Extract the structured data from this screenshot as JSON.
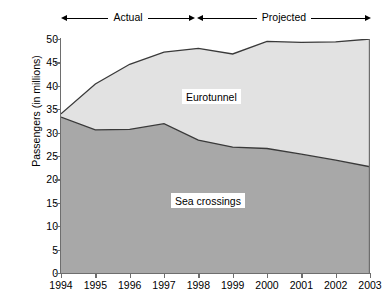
{
  "annotations": {
    "actual_label": "Actual",
    "projected_label": "Projected"
  },
  "axes": {
    "ylabel": "Passengers (in millions)",
    "yticks": [
      "50",
      "45",
      "40",
      "35",
      "30",
      "25",
      "20",
      "15",
      "10",
      "5",
      "0"
    ],
    "xticks": [
      "1994",
      "1995",
      "1996",
      "1997",
      "1998",
      "1999",
      "2000",
      "2001",
      "2002",
      "2003"
    ]
  },
  "series_labels": {
    "eurotunnel": "Eurotunnel",
    "sea_crossings": "Sea crossings"
  },
  "colors": {
    "eurotunnel_fill": "#e2e2e2",
    "sea_fill": "#a8a8a8",
    "line": "#3a3a3a",
    "axis": "#6e6e6e",
    "text": "#000000"
  },
  "chart_data": {
    "type": "area",
    "title": "",
    "subtitle": "",
    "xlabel": "",
    "ylabel": "Passengers (in millions)",
    "x": [
      1994,
      1995,
      1996,
      1997,
      1998,
      1999,
      2000,
      2001,
      2002,
      2003
    ],
    "xlim": [
      1994,
      2003
    ],
    "ylim": [
      0,
      50
    ],
    "ytick_step": 5,
    "grid": false,
    "legend": "inline-labels",
    "stacked": true,
    "series": [
      {
        "name": "Sea crossings",
        "values": [
          33.3,
          30.6,
          30.7,
          31.9,
          28.4,
          26.9,
          26.6,
          25.4,
          24.1,
          22.7
        ]
      },
      {
        "name": "Eurotunnel",
        "values": [
          0.7,
          9.8,
          13.9,
          15.3,
          19.6,
          19.9,
          22.9,
          23.9,
          25.3,
          27.3
        ]
      }
    ],
    "cumulative_top": [
      34.0,
      40.4,
      44.6,
      47.2,
      48.0,
      46.8,
      49.5,
      49.3,
      49.4,
      50.0
    ],
    "annotations": [
      {
        "text": "Actual",
        "x_range": [
          1994,
          1997.9
        ]
      },
      {
        "text": "Projected",
        "x_range": [
          1997.9,
          2003
        ]
      }
    ]
  }
}
